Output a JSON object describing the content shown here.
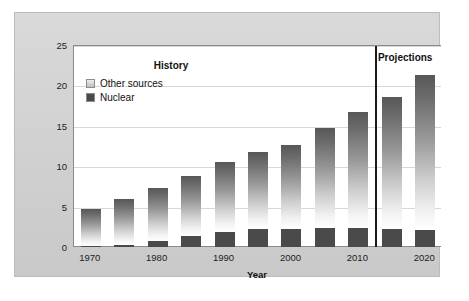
{
  "chart_data": {
    "type": "bar",
    "stacked": true,
    "title": "",
    "xlabel": "Year",
    "ylabel": "Trillion kilowatt-hours",
    "ylim": [
      0,
      25
    ],
    "yticks": [
      0,
      5,
      10,
      15,
      20,
      25
    ],
    "ytick_labels": [
      "0",
      "5",
      "10",
      "15",
      "20",
      "25"
    ],
    "grid": true,
    "grid_axis": "y",
    "categories": [
      1970,
      1975,
      1980,
      1985,
      1990,
      1995,
      2000,
      2005,
      2010,
      2015,
      2020
    ],
    "xtick_labels": [
      "1970",
      "1980",
      "1990",
      "2000",
      "2010",
      "2020"
    ],
    "xticks_shown": [
      1970,
      1980,
      1990,
      2000,
      2010,
      2020
    ],
    "legend_position": "upper left",
    "series": [
      {
        "name": "Nuclear",
        "color": "#4a4a4a",
        "values": [
          0.1,
          0.2,
          0.7,
          1.4,
          1.9,
          2.2,
          2.2,
          2.3,
          2.4,
          2.2,
          2.1
        ]
      },
      {
        "name": "Other sources",
        "color": "#9a9a9a",
        "values": [
          4.6,
          5.7,
          6.6,
          7.4,
          8.6,
          9.5,
          10.4,
          12.4,
          14.3,
          16.4,
          19.2
        ]
      }
    ],
    "totals": [
      4.7,
      5.9,
      7.3,
      8.8,
      10.5,
      11.7,
      12.6,
      14.7,
      16.7,
      18.6,
      21.3
    ],
    "annotations": [
      {
        "text": "History",
        "x": 1982,
        "y": 22.6
      },
      {
        "text": "Projections",
        "x": 2017,
        "y": 23.6
      }
    ],
    "divider": {
      "x": 2012.5,
      "label": "history-projection-divider",
      "color": "#1a1a1a"
    }
  },
  "legend": {
    "items": [
      {
        "label": "Other sources",
        "swatch": "other-sources-swatch"
      },
      {
        "label": "Nuclear",
        "swatch": "nuclear-swatch"
      }
    ]
  },
  "colors": {
    "frame_background": "#d2d2d2",
    "plot_background": "#ffffff",
    "axis": "#8a8a8a",
    "gridline": "#d8d8d8",
    "nuclear": "#4a4a4a",
    "other_sources": "#9a9a9a",
    "divider": "#1a1a1a",
    "text": "#1c1c1c"
  }
}
